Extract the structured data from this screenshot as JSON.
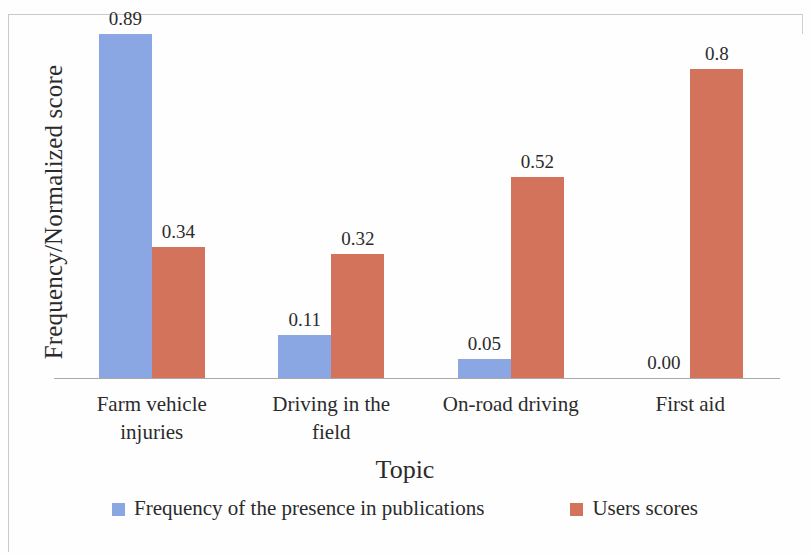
{
  "chart_data": {
    "type": "bar",
    "title": "",
    "subtitle": "",
    "xlabel": "Topic",
    "ylabel": "Frequency/Normalized score",
    "categories": [
      "Farm vehicle injuries",
      "Driving in the field",
      "On-road driving",
      "First aid"
    ],
    "category_lines": [
      [
        "Farm vehicle",
        "injuries"
      ],
      [
        "Driving in the",
        "field"
      ],
      [
        "On-road driving"
      ],
      [
        "First aid"
      ]
    ],
    "series": [
      {
        "name": "Frequency of the presence in publications",
        "color": "#8ba7e3",
        "values": [
          0.89,
          0.11,
          0.05,
          0.0
        ],
        "labels": [
          "0.89",
          "0.11",
          "0.05",
          "0.00"
        ]
      },
      {
        "name": "Users scores",
        "color": "#d4735c",
        "values": [
          0.34,
          0.32,
          0.52,
          0.8
        ],
        "labels": [
          "0.34",
          "0.32",
          "0.52",
          "0.8"
        ]
      }
    ],
    "ylim": [
      0,
      0.9
    ],
    "grid": false,
    "legend_position": "bottom",
    "axis_color": "#a9a9a9"
  },
  "legend": {
    "items": [
      {
        "label": "Frequency of the presence in publications"
      },
      {
        "label": "Users scores"
      }
    ]
  }
}
